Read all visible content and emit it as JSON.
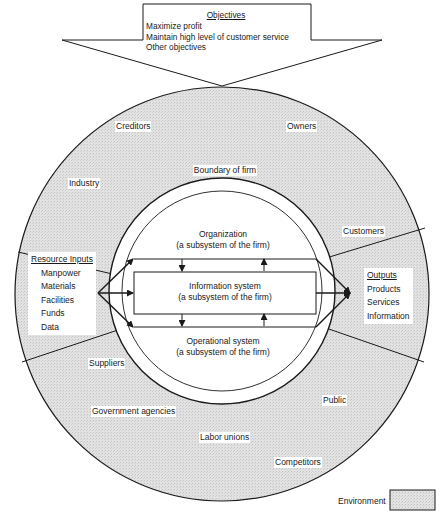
{
  "objectives": {
    "title": "Objectives",
    "items": [
      "Maximize profit",
      "Maintain high level of customer service",
      "Other objectives"
    ]
  },
  "environment_entities": {
    "creditors": "Creditors",
    "owners": "Owners",
    "industry": "Industry",
    "customers": "Customers",
    "suppliers": "Suppliers",
    "government": "Government agencies",
    "public": "Public",
    "labor": "Labor unions",
    "competitors": "Competitors"
  },
  "firm": {
    "boundary": "Boundary of firm",
    "organization": {
      "name": "Organization",
      "sub": "(a subsystem of the firm)"
    },
    "information": {
      "name": "Information system",
      "sub": "(a subsystem of the firm)"
    },
    "operational": {
      "name": "Operational system",
      "sub": "(a subsystem of the firm)"
    }
  },
  "inputs": {
    "title": "Resource Inputs",
    "items": [
      "Manpower",
      "Materials",
      "Facilities",
      "Funds",
      "Data"
    ]
  },
  "outputs": {
    "title": "Outputs",
    "items": [
      "Products",
      "Services",
      "Information"
    ]
  },
  "legend": {
    "label": "Environment",
    "swatch_color": "#dcdcdc"
  },
  "colors": {
    "environment_fill": "#dcdcdc",
    "line": "#1a1a1a",
    "background": "#ffffff"
  }
}
